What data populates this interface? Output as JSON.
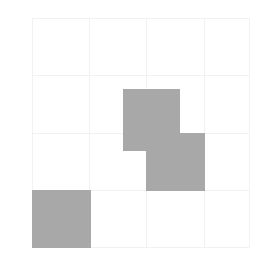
{
  "figure": {
    "width": 276,
    "height": 263,
    "background_color": "#ffffff"
  },
  "plot": {
    "left": 32,
    "top": 18,
    "width": 218,
    "height": 230,
    "grid_color": "#f2f2f2",
    "grid_visible": true
  },
  "chart_data": {
    "type": "heatmap",
    "title": "",
    "subtitle": "",
    "xlabel": "",
    "ylabel": "",
    "legend": [],
    "annotations": [],
    "grid": true,
    "n_cols": 4,
    "n_rows": 4,
    "categories": [
      "0",
      "1",
      "2",
      "3"
    ],
    "x": [
      "0",
      "1",
      "2",
      "3"
    ],
    "y": [
      "0",
      "1",
      "2",
      "3"
    ],
    "xticklabels": [],
    "yticklabels": [],
    "xlim": [
      0,
      4
    ],
    "ylim": [
      0,
      4
    ],
    "fill_color": "#a8a8a8",
    "empty_color": "#ffffff",
    "values": [
      [
        0,
        1,
        0,
        0
      ],
      [
        0,
        0,
        1,
        0
      ],
      [
        0,
        0,
        0,
        0
      ],
      [
        1,
        0,
        0,
        0
      ]
    ],
    "filled_cells": [
      {
        "label": "cell-r0-c1",
        "col": 1,
        "row": 0,
        "value": 1,
        "x": 91,
        "y": 71,
        "w": 57,
        "h": 62,
        "color": "#a8a8a8"
      },
      {
        "label": "cell-r1-c2",
        "col": 2,
        "row": 1,
        "value": 1,
        "x": 114,
        "y": 115,
        "w": 59,
        "h": 58,
        "color": "#a8a8a8"
      },
      {
        "label": "cell-r3-c0",
        "col": 0,
        "row": 3,
        "value": 1,
        "x": 0,
        "y": 172,
        "w": 59,
        "h": 58,
        "color": "#a8a8a8"
      }
    ],
    "gridlines_v": [
      0,
      57,
      114,
      172,
      218
    ],
    "gridlines_h": [
      0,
      57,
      115,
      172,
      230
    ]
  }
}
